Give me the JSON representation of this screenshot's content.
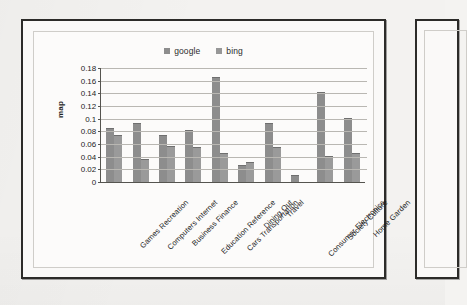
{
  "figure": {
    "ylabel": "map",
    "legend": [
      {
        "name": "google",
        "color": "#8d8d8d"
      },
      {
        "name": "bing",
        "color": "#9a9a9a"
      }
    ]
  },
  "chart_data": {
    "type": "bar",
    "title": "",
    "xlabel": "",
    "ylabel": "map",
    "ylim": [
      0,
      0.18
    ],
    "ytick_step": 0.02,
    "yticks": [
      "0.18",
      "0.16",
      "0.14",
      "0.12",
      "0.1",
      "0.08",
      "0.06",
      "0.04",
      "0.02",
      "0"
    ],
    "ytick_values": [
      0.18,
      0.16,
      0.14,
      0.12,
      0.1,
      0.08,
      0.06,
      0.04,
      0.02,
      0
    ],
    "grid": true,
    "legend_position": "top-center",
    "categories": [
      "Games Recreation",
      "Computers Internet",
      "Business Finance",
      "Education Reference",
      "Cars Transportation",
      "Dining Out",
      "Travel",
      "Consumer Electronics",
      "Society Culture",
      "Home Garden"
    ],
    "series": [
      {
        "name": "google",
        "color": "#8d8d8d",
        "values": [
          0.083,
          0.091,
          0.073,
          0.08,
          0.165,
          0.025,
          0.091,
          0.01,
          0.14,
          0.1
        ]
      },
      {
        "name": "bing",
        "color": "#9a9a9a",
        "values": [
          0.072,
          0.035,
          0.055,
          0.053,
          0.044,
          0.03,
          0.054,
          0.0,
          0.039,
          0.045
        ]
      }
    ]
  }
}
